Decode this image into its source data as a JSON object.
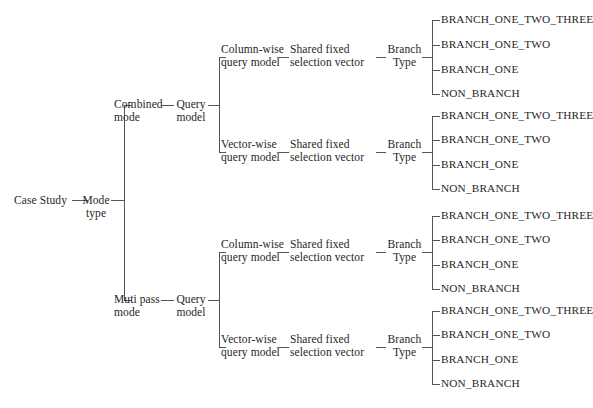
{
  "diagram": {
    "type": "tree",
    "orientation": "left-to-right",
    "root": {
      "label": "Case Study"
    },
    "level1": {
      "label_line1": "Mode",
      "label_line2": "type"
    },
    "modes": [
      {
        "label_line1": "Combined",
        "label_line2": "mode"
      },
      {
        "label_line1": "Muti pass",
        "label_line2": "mode"
      }
    ],
    "query_model": {
      "label_line1": "Query",
      "label_line2": "model"
    },
    "query_styles": [
      {
        "label_line1": "Column-wise",
        "label_line2": "query model"
      },
      {
        "label_line1": "Vector-wise",
        "label_line2": "query model"
      }
    ],
    "selection_vector": {
      "label_line1": "Shared fixed",
      "label_line2": "selection vector"
    },
    "branch_type": {
      "label_line1": "Branch",
      "label_line2": "Type"
    },
    "leaves": [
      "BRANCH_ONE_TWO_THREE",
      "BRANCH_ONE_TWO",
      "BRANCH_ONE",
      "NON_BRANCH"
    ],
    "groups": [
      {
        "mode": "Combined mode",
        "query_style": "Column-wise query model",
        "leaves": [
          "BRANCH_ONE_TWO_THREE",
          "BRANCH_ONE_TWO",
          "BRANCH_ONE",
          "NON_BRANCH"
        ]
      },
      {
        "mode": "Combined mode",
        "query_style": "Vector-wise query model",
        "leaves": [
          "BRANCH_ONE_TWO_THREE",
          "BRANCH_ONE_TWO",
          "BRANCH_ONE",
          "NON_BRANCH"
        ]
      },
      {
        "mode": "Muti pass mode",
        "query_style": "Column-wise query model",
        "leaves": [
          "BRANCH_ONE_TWO_THREE",
          "BRANCH_ONE_TWO",
          "BRANCH_ONE",
          "NON_BRANCH"
        ]
      },
      {
        "mode": "Muti pass mode",
        "query_style": "Vector-wise query model",
        "leaves": [
          "BRANCH_ONE_TWO_THREE",
          "BRANCH_ONE_TWO",
          "BRANCH_ONE",
          "NON_BRANCH"
        ]
      }
    ],
    "caption": "",
    "line_color": "#555555",
    "text_color": "#262626"
  }
}
